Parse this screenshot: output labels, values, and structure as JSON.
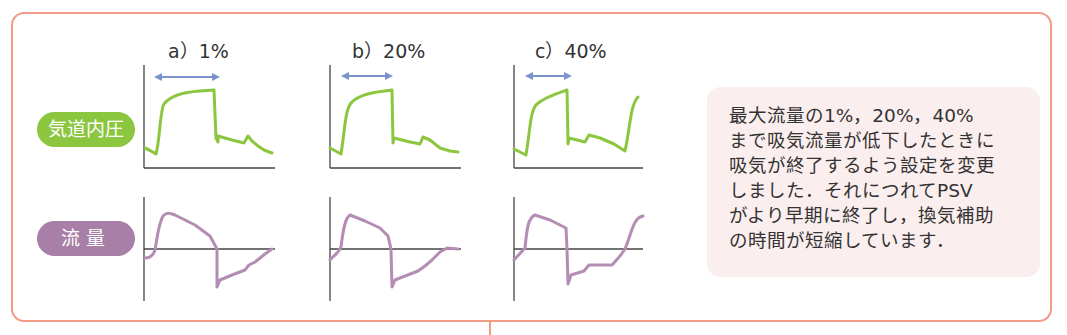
{
  "labels": {
    "pressure": "気道内圧",
    "flow": "流量"
  },
  "panels": [
    {
      "id": "a",
      "title": "a）1%"
    },
    {
      "id": "b",
      "title": "b）20%"
    },
    {
      "id": "c",
      "title": "c）40%"
    }
  ],
  "note": {
    "lines": [
      "最大流量の1%，20%，40%",
      "まで吸気流量が低下したときに",
      "吸気が終了するよう設定を変更",
      "しました．それにつれてPSV",
      "がより早期に終了し，換気補助",
      "の時間が短縮しています．"
    ]
  },
  "colors": {
    "frame": "#f19a86",
    "pressure_curve": "#8cc63f",
    "flow_curve": "#b48db4",
    "arrow": "#7b93cc",
    "note_bg": "#fbeeee"
  }
}
